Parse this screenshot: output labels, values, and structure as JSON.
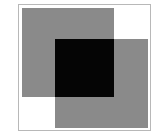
{
  "diagram": {
    "shapes": [
      {
        "name": "square-top-left",
        "color": "#8a8a8a"
      },
      {
        "name": "square-bottom-right",
        "color": "#8a8a8a"
      }
    ],
    "overlap_color": "#050505",
    "frame_border_color": "#b8b8b8",
    "background_color": "#ffffff"
  }
}
